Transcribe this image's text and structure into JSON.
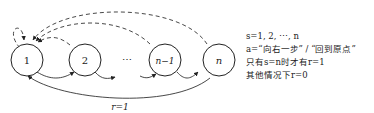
{
  "diagram": {
    "states": [
      {
        "id": "s1",
        "label": "1"
      },
      {
        "id": "s2",
        "label": "2"
      },
      {
        "id": "ellipsis",
        "label": "⋯"
      },
      {
        "id": "sn1",
        "label": "n−1"
      },
      {
        "id": "sn",
        "label": "n"
      }
    ],
    "bottom_edge_label": "r=1",
    "legend": [
      "s=1, 2, ⋯, n",
      "a=“向右一步” / “回到原点”",
      "只有s=n时才有r=1",
      "其他情况下r=0"
    ]
  }
}
